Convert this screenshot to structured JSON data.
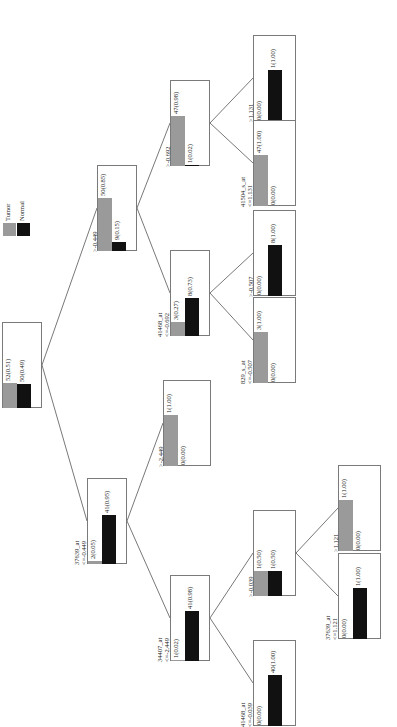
{
  "legend": {
    "items": [
      {
        "label": "Tumor",
        "color": "#9a9a9a"
      },
      {
        "label": "Normal",
        "color": "#111111"
      }
    ]
  },
  "nodes": {
    "root": {
      "split": "",
      "tumor": "52(0.51)",
      "normal": "50(0.49)",
      "tumor_frac": 0.51,
      "normal_frac": 0.49
    },
    "n_left": {
      "split": "37639_at",
      "cond": "<=-0.449",
      "tumor": "2(0.05)",
      "normal": "41(0.95)",
      "tumor_frac": 0.05,
      "normal_frac": 0.95
    },
    "n_right": {
      "split": "",
      "cond": ">-0.449",
      "tumor": "50(0.85)",
      "normal": "9(0.15)",
      "tumor_frac": 0.85,
      "normal_frac": 0.15
    },
    "n_rr": {
      "split": "",
      "cond": ">-0.692",
      "tumor": "47(0.98)",
      "normal": "1(0.02)",
      "tumor_frac": 0.98,
      "normal_frac": 0.02
    },
    "n_rl": {
      "split": "41468_at",
      "cond": "<=-0.692",
      "tumor": "3(0.27)",
      "normal": "8(0.73)",
      "tumor_frac": 0.27,
      "normal_frac": 0.73
    },
    "n_rrr": {
      "split": "",
      "cond": ">1.131",
      "tumor": "0(0.00)",
      "normal": "1(1.00)",
      "tumor_frac": 0.0,
      "normal_frac": 1.0
    },
    "n_rrl": {
      "split": "41504_s_at",
      "cond": "<=1.131",
      "tumor": "47(1.00)",
      "normal": "0(0.00)",
      "tumor_frac": 1.0,
      "normal_frac": 0.0
    },
    "n_rlr": {
      "split": "",
      "cond": ">-0.507",
      "tumor": "0(0.00)",
      "normal": "8(1.00)",
      "tumor_frac": 0.0,
      "normal_frac": 1.0
    },
    "n_rll": {
      "split": "829_s_at",
      "cond": "<=-0.507",
      "tumor": "3(1.00)",
      "normal": "0(0.00)",
      "tumor_frac": 1.0,
      "normal_frac": 0.0
    },
    "n_lr": {
      "split": "",
      "cond": ">-2.449",
      "tumor": "1(1.00)",
      "normal": "0(0.00)",
      "tumor_frac": 1.0,
      "normal_frac": 0.0
    },
    "n_ll": {
      "split": "34407_at",
      "cond": "<=-2.449",
      "tumor": "1(0.02)",
      "normal": "41(0.98)",
      "tumor_frac": 0.02,
      "normal_frac": 0.98
    },
    "n_llr": {
      "split": "",
      "cond": ">-0.039",
      "tumor": "1(0.50)",
      "normal": "1(0.50)",
      "tumor_frac": 0.5,
      "normal_frac": 0.5
    },
    "n_lll": {
      "split": "41468_at",
      "cond": "<=-0.039",
      "tumor": "0(0.00)",
      "normal": "40(1.00)",
      "tumor_frac": 0.0,
      "normal_frac": 1.0
    },
    "n_llrr": {
      "split": "",
      "cond": ">1.121",
      "tumor": "1(1.00)",
      "normal": "0(0.00)",
      "tumor_frac": 1.0,
      "normal_frac": 0.0
    },
    "n_llrl": {
      "split": "37639_at",
      "cond": "<=1.121",
      "tumor": "0(0.00)",
      "normal": "1(1.00)",
      "tumor_frac": 0.0,
      "normal_frac": 1.0
    }
  }
}
